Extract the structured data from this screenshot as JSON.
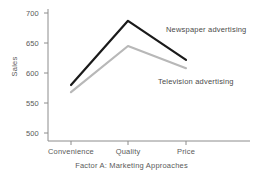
{
  "chart_data": {
    "type": "line",
    "title": "",
    "subtitle": "",
    "xlabel": "Factor A: Marketing Approaches",
    "ylabel": "Sales",
    "categories": [
      "Convenience",
      "Quality",
      "Price"
    ],
    "series": [
      {
        "name": "Newspaper advertising",
        "values": [
          580,
          687,
          622
        ],
        "color": "#1a1a1a"
      },
      {
        "name": "Television advertising",
        "values": [
          568,
          645,
          608
        ],
        "color": "#b8b8b8"
      }
    ],
    "ylim": [
      490,
      710
    ],
    "yticks": [
      500,
      550,
      600,
      650,
      700
    ],
    "ytick_labels": [
      "500",
      "550",
      "600",
      "650",
      "700"
    ],
    "xtick_labels": [
      "Convenience",
      "Quality",
      "Price"
    ],
    "grid": false,
    "legend": "inline-annotations",
    "legend_position": "right-of-lines",
    "annotations": [
      {
        "text": "Newspaper advertising",
        "series": "Newspaper advertising"
      },
      {
        "text": "Television advertising",
        "series": "Television advertising"
      }
    ]
  },
  "axes": {
    "y_title": "Sales",
    "x_title": "Factor A: Marketing Approaches",
    "axis_color": "#8c8c8c"
  }
}
